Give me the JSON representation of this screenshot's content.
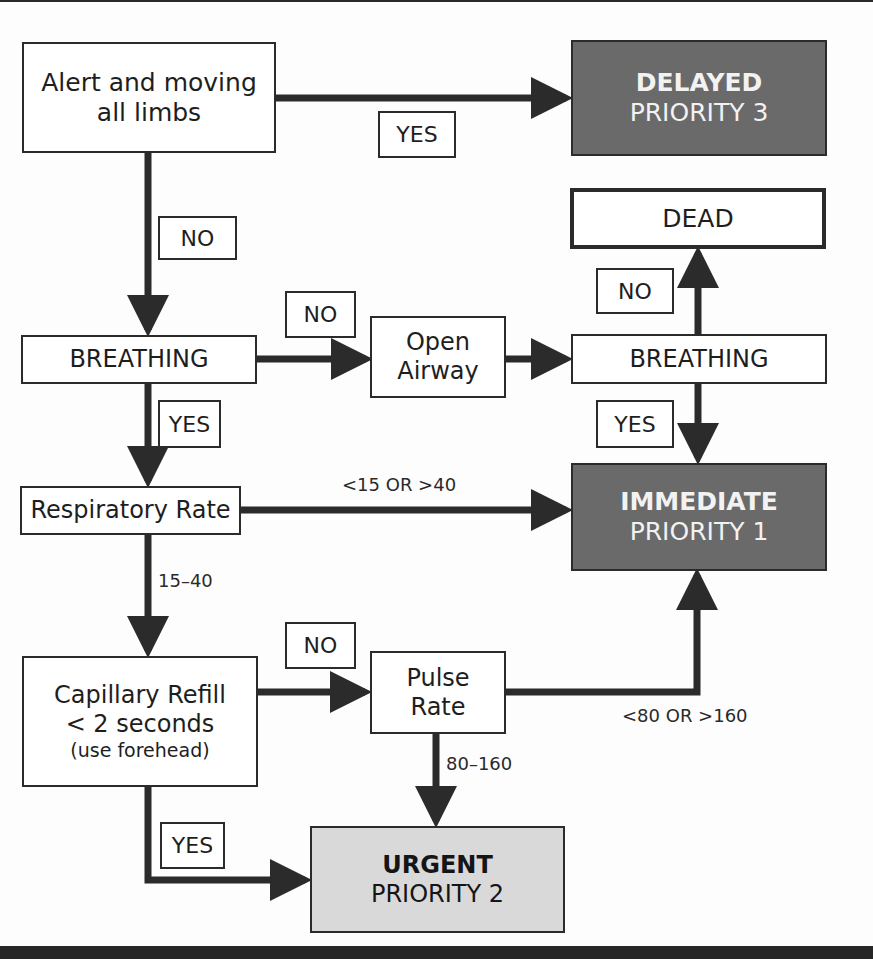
{
  "nodes": {
    "alert": {
      "line1": "Alert and moving",
      "line2": "all limbs"
    },
    "delayed": {
      "title": "DELAYED",
      "subtitle": "PRIORITY 3"
    },
    "dead": {
      "label": "DEAD"
    },
    "breathing_left": {
      "label": "BREATHING"
    },
    "open_airway": {
      "line1": "Open",
      "line2": "Airway"
    },
    "breathing_right": {
      "label": "BREATHING"
    },
    "respiratory_rate": {
      "label": "Respiratory Rate"
    },
    "immediate": {
      "title": "IMMEDIATE",
      "subtitle": "PRIORITY 1"
    },
    "capillary_refill": {
      "line1": "Capillary Refill",
      "line2": "< 2 seconds",
      "line3": "(use forehead)"
    },
    "pulse_rate": {
      "line1": "Pulse",
      "line2": "Rate"
    },
    "urgent": {
      "title": "URGENT",
      "subtitle": "PRIORITY 2"
    }
  },
  "edge_tags": {
    "alert_yes": "YES",
    "alert_no": "NO",
    "breathing_no": "NO",
    "breathing_yes": "YES",
    "airway_no": "NO",
    "airway_yes": "YES",
    "capillary_no": "NO",
    "capillary_yes": "YES"
  },
  "edge_labels": {
    "resp_abnormal": "<15 OR >40",
    "resp_normal": "15–40",
    "pulse_normal": "80–160",
    "pulse_abnormal": "<80 OR >160"
  },
  "colors": {
    "dark_box": "#6a6a6a",
    "light_box": "#d9d9d9",
    "line": "#2b2b2b"
  }
}
